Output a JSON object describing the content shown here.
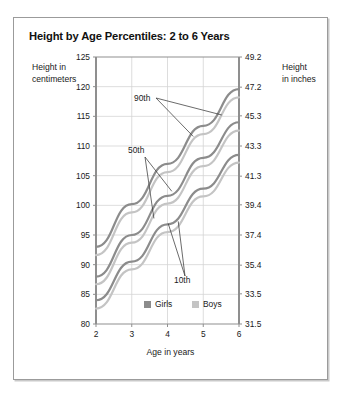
{
  "chart_title": "Height by Age Percentiles: 2 to 6 Years",
  "axes": {
    "y_left_title": "Height in\ncentimeters",
    "y_right_title": "Height\nin inches",
    "x_title": "Age in years"
  },
  "legend": {
    "items": [
      {
        "label": "Girls",
        "color": "#8c8c8c"
      },
      {
        "label": "Boys",
        "color": "#c4c4c4"
      }
    ]
  },
  "annotations": [
    {
      "label": "90th"
    },
    {
      "label": "50th"
    },
    {
      "label": "10th"
    }
  ],
  "chart_data": {
    "type": "line",
    "title": "Height by Age Percentiles: 2 to 6 Years",
    "xlabel": "Age in years",
    "ylabel": "Height in centimeters",
    "ylabel_secondary": "Height in inches",
    "grid": true,
    "legend_position": "inside-bottom-center",
    "x": [
      2,
      3,
      4,
      5,
      6
    ],
    "xlim": [
      2,
      6
    ],
    "xticks": [
      2,
      3,
      4,
      5,
      6
    ],
    "xticklabels": [
      "2",
      "3",
      "4",
      "5",
      "6"
    ],
    "ylim": [
      80,
      125
    ],
    "yticks": [
      80,
      85,
      90,
      95,
      100,
      105,
      110,
      115,
      120,
      125
    ],
    "yticklabels": [
      "80",
      "85",
      "90",
      "95",
      "100",
      "105",
      "110",
      "115",
      "120",
      "125"
    ],
    "y2lim": [
      31.5,
      49.2
    ],
    "y2ticks": [
      31.5,
      33.5,
      35.4,
      37.4,
      39.4,
      41.3,
      43.3,
      45.3,
      47.2,
      49.2
    ],
    "y2ticklabels": [
      "31.5",
      "33.5",
      "35.4",
      "37.4",
      "39.4",
      "41.3",
      "43.3",
      "45.3",
      "47.2",
      "49.2"
    ],
    "series": [
      {
        "name": "Girls 90th",
        "group": "Girls",
        "percentile": "90th",
        "color": "#8c8c8c",
        "values": [
          93.0,
          100.2,
          107.0,
          113.4,
          119.6
        ]
      },
      {
        "name": "Boys 90th",
        "group": "Boys",
        "percentile": "90th",
        "color": "#c4c4c4",
        "values": [
          91.6,
          98.8,
          105.6,
          112.0,
          118.2
        ]
      },
      {
        "name": "Girls 50th",
        "group": "Girls",
        "percentile": "50th",
        "color": "#8c8c8c",
        "values": [
          88.0,
          95.0,
          101.6,
          108.0,
          114.0
        ]
      },
      {
        "name": "Boys 50th",
        "group": "Boys",
        "percentile": "50th",
        "color": "#c4c4c4",
        "values": [
          86.7,
          93.7,
          100.3,
          106.6,
          112.6
        ]
      },
      {
        "name": "Girls 10th",
        "group": "Girls",
        "percentile": "10th",
        "color": "#8c8c8c",
        "values": [
          84.0,
          90.5,
          96.8,
          102.8,
          108.5
        ]
      },
      {
        "name": "Boys 10th",
        "group": "Boys",
        "percentile": "10th",
        "color": "#c4c4c4",
        "values": [
          82.6,
          89.2,
          95.5,
          101.5,
          107.2
        ]
      }
    ]
  }
}
